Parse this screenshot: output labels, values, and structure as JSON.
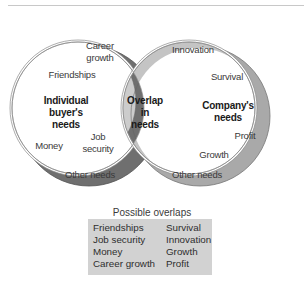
{
  "diagram": {
    "type": "venn",
    "left_circle": {
      "title_lines": [
        "Individual",
        "buyer's",
        "needs"
      ],
      "items": [
        {
          "id": "career_growth",
          "lines": [
            "Career",
            "growth"
          ]
        },
        {
          "id": "friendships",
          "lines": [
            "Friendships"
          ]
        },
        {
          "id": "money",
          "lines": [
            "Money"
          ]
        },
        {
          "id": "job_security",
          "lines": [
            "Job",
            "security"
          ]
        },
        {
          "id": "other_needs",
          "lines": [
            "Other needs"
          ]
        }
      ]
    },
    "overlap": {
      "title_lines": [
        "Overlap",
        "in",
        "needs"
      ]
    },
    "right_circle": {
      "title_lines": [
        "Company's",
        "needs"
      ],
      "items": [
        {
          "id": "innovation",
          "lines": [
            "Innovation"
          ]
        },
        {
          "id": "survival",
          "lines": [
            "Survival"
          ]
        },
        {
          "id": "profit",
          "lines": [
            "Profit"
          ]
        },
        {
          "id": "growth",
          "lines": [
            "Growth"
          ]
        },
        {
          "id": "other_needs",
          "lines": [
            "Other needs"
          ]
        }
      ]
    },
    "colors": {
      "left_shadow": "#6e6e6e",
      "right_shadow": "#a8a8a8",
      "overlap_fill": "#cfcfcf",
      "face": "#ffffff",
      "stroke": "#7a7a7a",
      "box_fill": "#d2d2d2"
    }
  },
  "possible_overlaps": {
    "caption": "Possible overlaps",
    "left_column": [
      "Friendships",
      "Job security",
      "Money",
      "Career growth"
    ],
    "right_column": [
      "Survival",
      "Innovation",
      "Growth",
      "Profit"
    ]
  }
}
